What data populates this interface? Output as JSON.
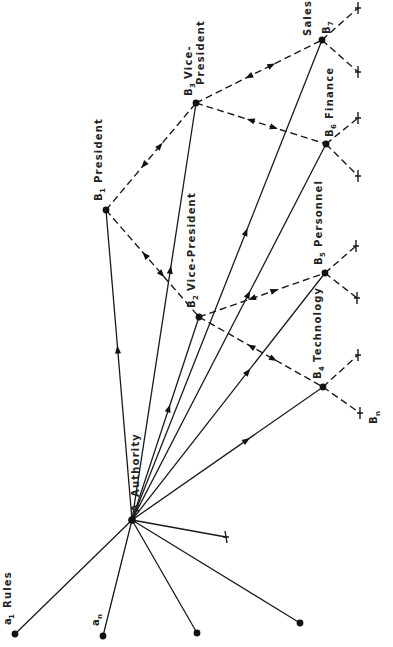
{
  "diagram": {
    "type": "organization-authority-network",
    "root": {
      "id": "A",
      "letter": "A",
      "label": "Authority"
    },
    "rules": [
      {
        "id": "a1",
        "letter": "a",
        "subscript": "1",
        "label": "Rules"
      },
      {
        "id": "an",
        "letter": "a",
        "subscript": "n",
        "label": ""
      },
      {
        "id": "r3",
        "letter": "",
        "subscript": "",
        "label": ""
      },
      {
        "id": "r4",
        "letter": "",
        "subscript": "",
        "label": ""
      }
    ],
    "positions": [
      {
        "id": "B1",
        "letter": "B",
        "subscript": "1",
        "label": "President"
      },
      {
        "id": "B2",
        "letter": "B",
        "subscript": "2",
        "label": "Vice-President"
      },
      {
        "id": "B3",
        "letter": "B",
        "subscript": "3",
        "label": "Vice-",
        "label2": "President"
      },
      {
        "id": "B4",
        "letter": "B",
        "subscript": "4",
        "label": "Technology"
      },
      {
        "id": "B5",
        "letter": "B",
        "subscript": "5",
        "label": "Personnel"
      },
      {
        "id": "B6",
        "letter": "B",
        "subscript": "6",
        "label": "Finance"
      },
      {
        "id": "B7",
        "letter": "B",
        "subscript": "7",
        "label": "Sales"
      }
    ],
    "terminal_label": {
      "letter": "B",
      "subscript": "n"
    },
    "edges": {
      "authority_solid": [
        {
          "from": "A",
          "to": "B1",
          "directed": true
        },
        {
          "from": "A",
          "to": "B2",
          "directed": true
        },
        {
          "from": "A",
          "to": "B3",
          "directed": true
        },
        {
          "from": "A",
          "to": "B4",
          "directed": true
        },
        {
          "from": "A",
          "to": "B5",
          "directed": true
        },
        {
          "from": "A",
          "to": "B6",
          "directed": true
        },
        {
          "from": "A",
          "to": "B7",
          "directed": true
        }
      ],
      "rules_solid": [
        {
          "from": "A",
          "to": "a1"
        },
        {
          "from": "A",
          "to": "an"
        },
        {
          "from": "A",
          "to": "r3"
        },
        {
          "from": "A",
          "to": "r4"
        },
        {
          "from": "A",
          "to": "truncated"
        }
      ],
      "hierarchy_dashed_bidirectional": [
        {
          "from": "B1",
          "to": "B3"
        },
        {
          "from": "B1",
          "to": "B2"
        },
        {
          "from": "B3",
          "to": "B7"
        },
        {
          "from": "B3",
          "to": "B6"
        },
        {
          "from": "B2",
          "to": "B5"
        },
        {
          "from": "B2",
          "to": "B4"
        }
      ],
      "terminal_dashed": [
        "B7",
        "B7",
        "B6",
        "B6",
        "B5",
        "B5",
        "B4",
        "B4"
      ]
    }
  }
}
